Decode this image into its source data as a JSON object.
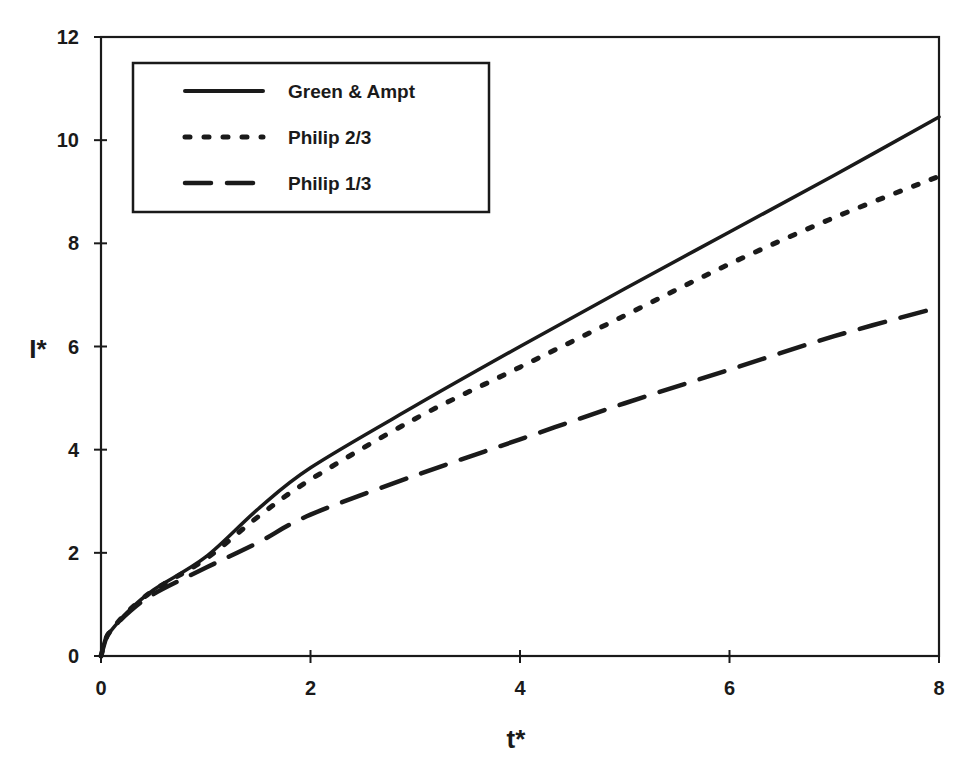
{
  "chart_data": {
    "type": "line",
    "title": "",
    "xlabel": "t*",
    "ylabel": "I*",
    "xlim": [
      0,
      8
    ],
    "ylim": [
      0,
      12
    ],
    "xticks": [
      0,
      2,
      4,
      6,
      8
    ],
    "yticks": [
      0,
      2,
      4,
      6,
      8,
      10,
      12
    ],
    "grid": false,
    "legend_position": "upper-left",
    "x": [
      0,
      0.05,
      0.1,
      0.25,
      0.5,
      1,
      1.5,
      2,
      3,
      4,
      5,
      6,
      7,
      8
    ],
    "series": [
      {
        "name": "Green & Ampt",
        "style": "solid",
        "values": [
          0,
          0.35,
          0.5,
          0.85,
          1.28,
          1.92,
          2.85,
          3.65,
          4.85,
          6.0,
          7.12,
          8.22,
          9.32,
          10.45
        ]
      },
      {
        "name": "Philip 2/3",
        "style": "dotted",
        "values": [
          0,
          0.35,
          0.5,
          0.85,
          1.27,
          1.88,
          2.7,
          3.42,
          4.6,
          5.6,
          6.6,
          7.6,
          8.5,
          9.3
        ]
      },
      {
        "name": "Philip 1/3",
        "style": "dashed",
        "values": [
          0,
          0.35,
          0.5,
          0.82,
          1.2,
          1.71,
          2.2,
          2.74,
          3.5,
          4.2,
          4.9,
          5.55,
          6.2,
          6.76
        ]
      }
    ]
  },
  "legend": {
    "items": [
      {
        "label": "Green & Ampt",
        "style": "solid"
      },
      {
        "label": "Philip 2/3",
        "style": "dotted"
      },
      {
        "label": "Philip 1/3",
        "style": "dashed"
      }
    ]
  },
  "axes": {
    "x_title": "t*",
    "y_title": "I*",
    "x_tick_labels": [
      "0",
      "2",
      "4",
      "6",
      "8"
    ],
    "y_tick_labels": [
      "0",
      "2",
      "4",
      "6",
      "8",
      "10",
      "12"
    ]
  },
  "colors": {
    "line": "#1a1a1a",
    "background": "#ffffff"
  }
}
